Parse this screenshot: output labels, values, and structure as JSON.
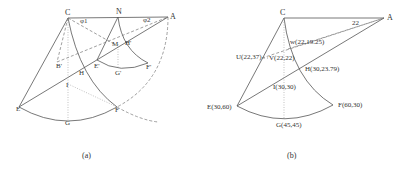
{
  "figure": {
    "panels": [
      {
        "id": "a",
        "caption": "(a)",
        "labels": {
          "C": "C",
          "N": "N",
          "A": "A",
          "phi1": "φ1",
          "phi2": "φ2",
          "B": "B'",
          "M": "M",
          "H_prime": "H'",
          "E_prime": "E'",
          "G_prime": "G'",
          "F_prime": "F'",
          "H": "H",
          "I": "I",
          "E": "E",
          "G": "G",
          "F": "F"
        }
      },
      {
        "id": "b",
        "caption": "(b)",
        "labels": {
          "C": "C",
          "A": "A",
          "angle": "22",
          "W": "w(22,19.25)",
          "U": "U(22,37)",
          "V": "V(22,22)",
          "H": "H(30,23.79)",
          "I": "I(30,30)",
          "E": "E(30,60)",
          "F": "F(60,30)",
          "G": "G(45,45)"
        }
      }
    ],
    "colors": {
      "line": "#555555",
      "dashed": "#777777",
      "dotted": "#999999",
      "text": "#333333"
    }
  }
}
